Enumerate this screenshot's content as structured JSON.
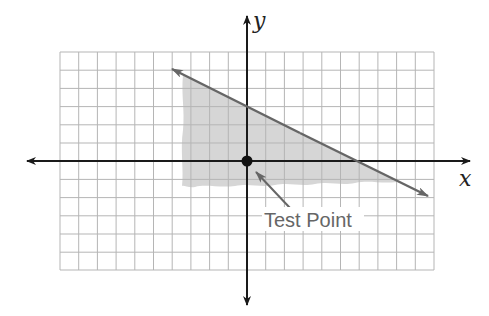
{
  "diagram": {
    "type": "linear-inequality-graph",
    "axes": {
      "x_label": "x",
      "y_label": "y"
    },
    "grid": {
      "columns": 20,
      "rows": 12,
      "x_range": [
        -10,
        10
      ],
      "y_range": [
        -6,
        6
      ]
    },
    "boundary_line": {
      "equation": "y = -x/2 + 3",
      "style": "solid",
      "points": [
        [
          -4,
          5
        ],
        [
          10,
          -2
        ]
      ]
    },
    "shaded_region": {
      "description": "below boundary line",
      "color": "#d6d6d6"
    },
    "test_point": {
      "label": "Test Point",
      "coordinates": [
        0,
        0
      ]
    }
  },
  "colors": {
    "grid": "#b5b5b5",
    "axis": "#1a1a1a",
    "line": "#666666",
    "shade": "#d6d6d6",
    "label": "#666666"
  }
}
